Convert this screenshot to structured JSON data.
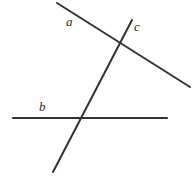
{
  "figure": {
    "kind": "geometry-diagram",
    "width": 194,
    "height": 179,
    "background_color": "#ffffff",
    "stroke_color": "#333333",
    "stroke_width": 2
  },
  "labels": {
    "a": "a",
    "b": "b",
    "c": "c"
  },
  "lines": [
    {
      "id": "a",
      "label": "a",
      "x1": 57,
      "y1": 3,
      "x2": 190,
      "y2": 87
    },
    {
      "id": "b",
      "label": "b",
      "x1": 13,
      "y1": 118,
      "x2": 167,
      "y2": 118
    },
    {
      "id": "c",
      "label": "c",
      "x1": 132,
      "y1": 20,
      "x2": 53,
      "y2": 172
    }
  ],
  "intersections": [
    {
      "lines": "a-c",
      "x": 120,
      "y": 48
    },
    {
      "lines": "b-c",
      "x": 85,
      "y": 119
    }
  ]
}
